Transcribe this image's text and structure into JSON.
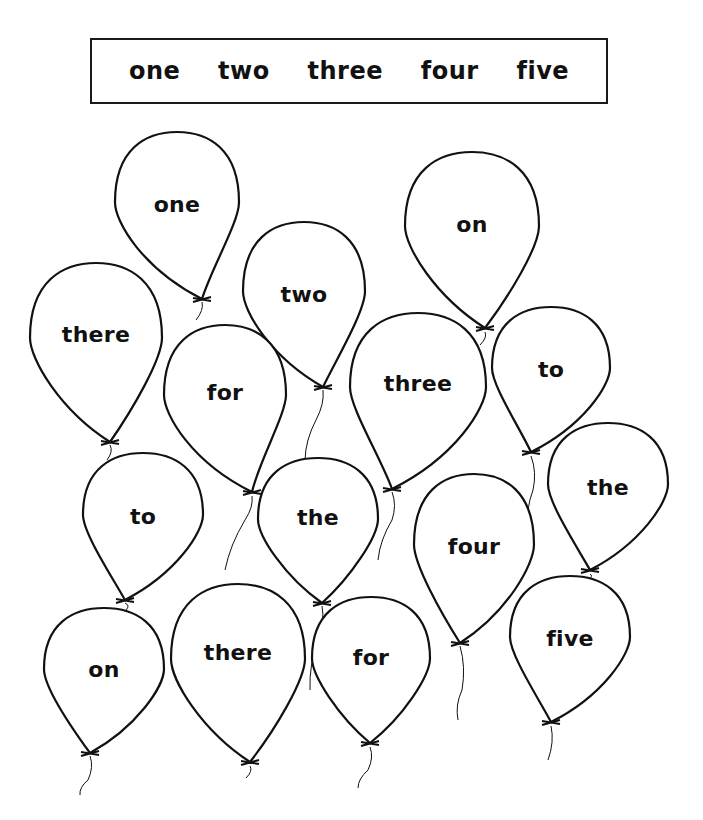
{
  "page": {
    "background": "#ffffff",
    "ink_color": "#111111"
  },
  "word_bank": {
    "words": [
      "one",
      "two",
      "three",
      "four",
      "five"
    ]
  },
  "balloons": [
    {
      "word": "one",
      "cx": 177,
      "top": 132,
      "w": 124,
      "h": 167,
      "text_y": 204,
      "knot_y": 299,
      "string": [
        [
          202,
          300
        ],
        [
          196,
          320
        ]
      ]
    },
    {
      "word": "two",
      "cx": 304,
      "top": 222,
      "w": 122,
      "h": 165,
      "text_y": 294,
      "knot_y": 387,
      "string": [
        [
          323,
          388
        ],
        [
          316,
          420
        ],
        [
          305,
          460
        ]
      ]
    },
    {
      "word": "on",
      "cx": 472,
      "top": 152,
      "w": 134,
      "h": 176,
      "text_y": 224,
      "knot_y": 328,
      "string": [
        [
          485,
          330
        ],
        [
          480,
          345
        ]
      ]
    },
    {
      "word": "there",
      "cx": 96,
      "top": 263,
      "w": 132,
      "h": 178,
      "text_y": 334,
      "knot_y": 442,
      "string": [
        [
          110,
          443
        ],
        [
          107,
          460
        ]
      ]
    },
    {
      "word": "for",
      "cx": 225,
      "top": 325,
      "w": 122,
      "h": 166,
      "text_y": 392,
      "knot_y": 492,
      "string": [
        [
          252,
          494
        ],
        [
          245,
          520
        ],
        [
          225,
          570
        ]
      ]
    },
    {
      "word": "three",
      "cx": 418,
      "top": 313,
      "w": 136,
      "h": 176,
      "text_y": 383,
      "knot_y": 489,
      "string": [
        [
          392,
          490
        ],
        [
          392,
          520
        ],
        [
          378,
          560
        ]
      ]
    },
    {
      "word": "to",
      "cx": 551,
      "top": 307,
      "w": 118,
      "h": 145,
      "text_y": 369,
      "knot_y": 452,
      "string": [
        [
          531,
          454
        ],
        [
          533,
          490
        ],
        [
          528,
          530
        ]
      ]
    },
    {
      "word": "to",
      "cx": 143,
      "top": 453,
      "w": 120,
      "h": 147,
      "text_y": 516,
      "knot_y": 600,
      "string": [
        [
          125,
          601
        ],
        [
          126,
          610
        ]
      ]
    },
    {
      "word": "the",
      "cx": 318,
      "top": 458,
      "w": 120,
      "h": 145,
      "text_y": 517,
      "knot_y": 603,
      "string": [
        [
          322,
          604
        ],
        [
          318,
          640
        ],
        [
          310,
          690
        ]
      ]
    },
    {
      "word": "the",
      "cx": 608,
      "top": 423,
      "w": 120,
      "h": 146,
      "text_y": 487,
      "knot_y": 570,
      "string": [
        [
          590,
          572
        ],
        [
          588,
          580
        ]
      ]
    },
    {
      "word": "four",
      "cx": 474,
      "top": 474,
      "w": 120,
      "h": 168,
      "text_y": 546,
      "knot_y": 643,
      "string": [
        [
          460,
          644
        ],
        [
          462,
          690
        ],
        [
          458,
          720
        ]
      ]
    },
    {
      "word": "five",
      "cx": 570,
      "top": 576,
      "w": 120,
      "h": 145,
      "text_y": 638,
      "knot_y": 722,
      "string": [
        [
          551,
          724
        ],
        [
          548,
          760
        ]
      ]
    },
    {
      "word": "on",
      "cx": 104,
      "top": 608,
      "w": 120,
      "h": 145,
      "text_y": 669,
      "knot_y": 753,
      "string": [
        [
          90,
          754
        ],
        [
          88,
          780
        ],
        [
          80,
          795
        ]
      ]
    },
    {
      "word": "there",
      "cx": 238,
      "top": 584,
      "w": 134,
      "h": 178,
      "text_y": 652,
      "knot_y": 762,
      "string": [
        [
          250,
          764
        ],
        [
          246,
          778
        ]
      ]
    },
    {
      "word": "for",
      "cx": 371,
      "top": 597,
      "w": 118,
      "h": 146,
      "text_y": 657,
      "knot_y": 743,
      "string": [
        [
          370,
          745
        ],
        [
          368,
          770
        ],
        [
          358,
          788
        ]
      ]
    }
  ]
}
